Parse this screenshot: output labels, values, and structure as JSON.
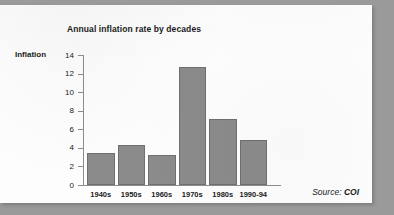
{
  "chart_data": {
    "type": "bar",
    "title": "Annual inflation rate by decades",
    "xlabel": "",
    "ylabel": "Inflation",
    "categories": [
      "1940s",
      "1950s",
      "1960s",
      "1970s",
      "1980s",
      "1990-94"
    ],
    "values": [
      3.4,
      4.3,
      3.2,
      12.7,
      7.1,
      4.9
    ],
    "ylim": [
      0,
      14
    ],
    "yticks": [
      0,
      2,
      4,
      6,
      8,
      10,
      12,
      14
    ],
    "grid": false,
    "legend": null,
    "bar_color": "#8b8b8b",
    "axis_color": "#8d8d8d",
    "text_color": "#1b1b1b"
  },
  "source": {
    "prefix": "Source:",
    "value": "COI"
  }
}
